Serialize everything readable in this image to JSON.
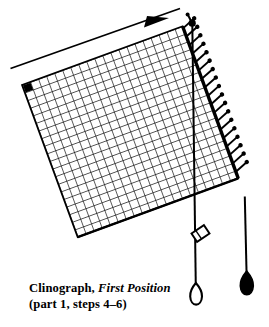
{
  "figure": {
    "title": "Clinograph, First Position",
    "caption": {
      "line1_roman_lead": "Clinograph,",
      "line1_italic": "First Position",
      "line2": "(part 1, steps 4–6)"
    },
    "colors": {
      "ink": "#000000",
      "paper": "#ffffff",
      "grid_line": "#1a1a1a",
      "plumb_bob_open_fill": "#ffffff"
    },
    "grid": {
      "name": "clinograph-grid-board",
      "columns": 20,
      "rows": 20,
      "rotation_degrees": -38,
      "corner_marker": "filled-black-square-top-left",
      "corners": {
        "top_left": [
          22,
          85
        ],
        "top_right": [
          192,
          23
        ],
        "bottom_right": [
          245,
          198
        ],
        "bottom_left": [
          49,
          245
        ]
      }
    },
    "annotations": {
      "direction_arrow_label": "rotation-direction-arrow",
      "pivot_label": "pivot-nail-top-right",
      "pin_row_label": "pin-row-right-edge",
      "pin_count": 17,
      "plumb_line_left_label": "plumb-line-open-bob",
      "plumb_line_right_label": "plumb-line-solid-bob",
      "bead_label": "sliding-bead"
    }
  }
}
